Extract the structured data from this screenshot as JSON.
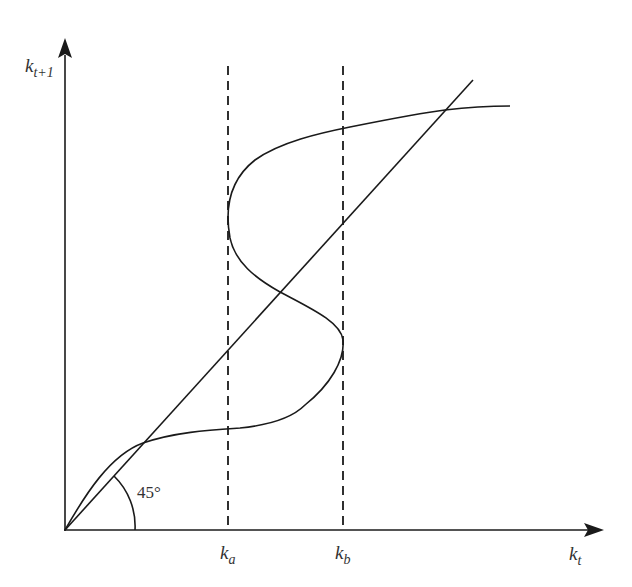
{
  "diagram": {
    "type": "phase-diagram",
    "axes": {
      "y_label_main": "k",
      "y_label_sub": "t+1",
      "x_label_main": "k",
      "x_label_sub": "t"
    },
    "reference_line": {
      "label": "45°",
      "meaning": "k_{t+1} = k_t"
    },
    "thresholds": [
      {
        "main": "k",
        "sub": "a"
      },
      {
        "main": "k",
        "sub": "b"
      }
    ],
    "colors": {
      "line": "#1a1a1a",
      "text": "#333333",
      "background": "#ffffff"
    }
  }
}
